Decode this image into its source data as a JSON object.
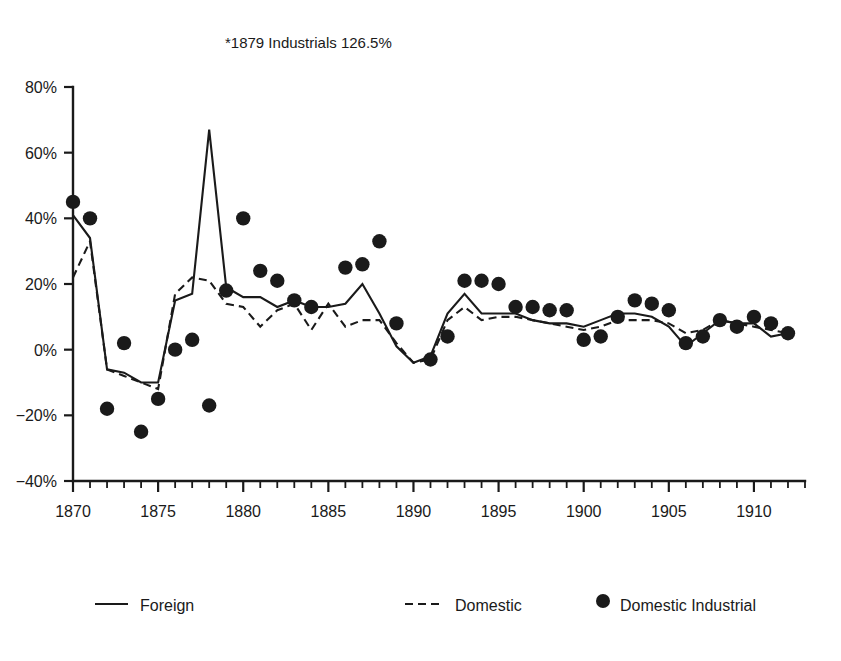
{
  "chart_data": {
    "type": "line",
    "title": "*1879 Industrials 126.5%",
    "xlabel": "",
    "ylabel": "",
    "grid": false,
    "legend_position": "bottom",
    "xlim": [
      1870,
      1913
    ],
    "ylim": [
      -40,
      80
    ],
    "y_ticks": [
      -40,
      -20,
      0,
      20,
      40,
      60,
      80
    ],
    "y_tick_labels": [
      "−40%",
      "−20%",
      "0%",
      "20%",
      "40%",
      "60%",
      "80%"
    ],
    "x_ticks": [
      1870,
      1875,
      1880,
      1885,
      1890,
      1895,
      1900,
      1905,
      1910
    ],
    "x_tick_labels": [
      "1870",
      "1875",
      "1880",
      "1885",
      "1890",
      "1895",
      "1900",
      "1905",
      "1910"
    ],
    "x_minor_tick_interval": 1,
    "x": [
      1870,
      1871,
      1872,
      1873,
      1874,
      1875,
      1876,
      1877,
      1878,
      1879,
      1880,
      1881,
      1882,
      1883,
      1884,
      1885,
      1886,
      1887,
      1888,
      1889,
      1890,
      1891,
      1892,
      1893,
      1894,
      1895,
      1896,
      1897,
      1898,
      1899,
      1900,
      1901,
      1902,
      1903,
      1904,
      1905,
      1906,
      1907,
      1908,
      1909,
      1910,
      1911,
      1912
    ],
    "series": [
      {
        "name": "Foreign",
        "style": "solid",
        "values": [
          41,
          34,
          -6,
          -7,
          -10,
          -10,
          15,
          17,
          67,
          19,
          16,
          16,
          13,
          15,
          13,
          13,
          14,
          20,
          11,
          1,
          -4,
          -2,
          11,
          17,
          11,
          11,
          11,
          9,
          8,
          8,
          7,
          9,
          11,
          11,
          10,
          7,
          1,
          5,
          9,
          8,
          8,
          4,
          5
        ]
      },
      {
        "name": "Domestic",
        "style": "dashed",
        "values": [
          22,
          33,
          -6,
          -8,
          -10,
          -12,
          17,
          22,
          21,
          14,
          13,
          7,
          12,
          14,
          6,
          14,
          7,
          9,
          9,
          2,
          -4,
          -3,
          9,
          13,
          9,
          10,
          10,
          9,
          8,
          7,
          6,
          7,
          9,
          9,
          9,
          8,
          5,
          6,
          9,
          8,
          7,
          6,
          5
        ]
      }
    ],
    "points": [
      {
        "name": "Domestic Industrial",
        "style": "dot",
        "x": [
          1870,
          1871,
          1872,
          1873,
          1874,
          1875,
          1876,
          1877,
          1878,
          1879,
          1880,
          1881,
          1882,
          1883,
          1884,
          1886,
          1887,
          1888,
          1889,
          1891,
          1892,
          1893,
          1894,
          1895,
          1896,
          1897,
          1898,
          1899,
          1900,
          1901,
          1902,
          1903,
          1904,
          1905,
          1906,
          1907,
          1908,
          1909,
          1910,
          1911,
          1912
        ],
        "y": [
          45,
          40,
          -18,
          2,
          -25,
          -15,
          0,
          3,
          -17,
          18,
          40,
          24,
          21,
          15,
          13,
          25,
          26,
          33,
          8,
          -3,
          4,
          21,
          21,
          20,
          13,
          13,
          12,
          12,
          3,
          4,
          10,
          15,
          14,
          12,
          2,
          4,
          9,
          7,
          10,
          8,
          5
        ]
      }
    ]
  },
  "legend": {
    "entries": [
      {
        "label": "Foreign",
        "marker": "solid-line"
      },
      {
        "label": "Domestic",
        "marker": "dashed-line"
      },
      {
        "label": "Domestic Industrial",
        "marker": "filled-circle"
      }
    ]
  },
  "colors": {
    "ink": "#1a1a1a",
    "background": "#ffffff"
  }
}
